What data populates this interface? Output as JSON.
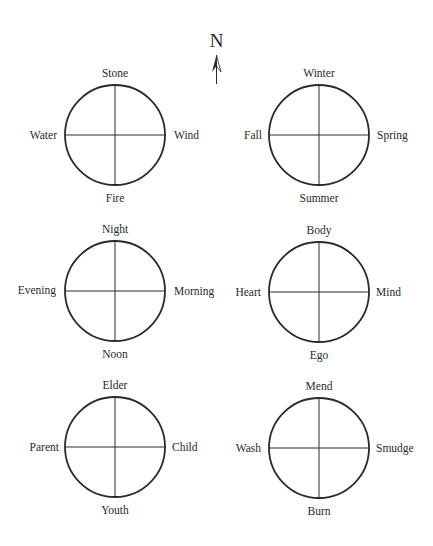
{
  "compass": {
    "north_label": "N",
    "icon": "north-arrow-icon"
  },
  "wheels": [
    {
      "id": "elements",
      "top": "Stone",
      "right": "Wind",
      "bottom": "Fire",
      "left": "Water",
      "cx": 115,
      "cy": 135
    },
    {
      "id": "seasons",
      "top": "Winter",
      "right": "Spring",
      "bottom": "Summer",
      "left": "Fall",
      "cx": 319,
      "cy": 135
    },
    {
      "id": "times-of-day",
      "top": "Night",
      "right": "Morning",
      "bottom": "Noon",
      "left": "Evening",
      "cx": 115,
      "cy": 291
    },
    {
      "id": "self",
      "top": "Body",
      "right": "Mind",
      "bottom": "Ego",
      "left": "Heart",
      "cx": 319,
      "cy": 292
    },
    {
      "id": "life-stages",
      "top": "Elder",
      "right": "Child",
      "bottom": "Youth",
      "left": "Parent",
      "cx": 115,
      "cy": 447
    },
    {
      "id": "cleansing",
      "top": "Mend",
      "right": "Smudge",
      "bottom": "Burn",
      "left": "Wash",
      "cx": 319,
      "cy": 448
    }
  ],
  "style": {
    "stroke_color": "#2a2a2a",
    "radius": 50
  }
}
